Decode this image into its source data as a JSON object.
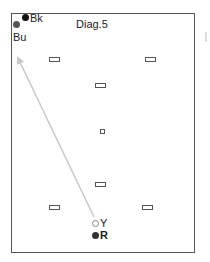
{
  "diagram": {
    "title": "Diag.5",
    "colors": {
      "frame": "#555555",
      "arrow": "#c8c8c8",
      "black_marker": "#111111",
      "grey_marker": "#555555",
      "hollow_marker": "#888888",
      "dash": "#555555"
    },
    "markers": [
      {
        "id": "Bk",
        "label": "Bk",
        "style": "filled-black"
      },
      {
        "id": "Bu",
        "label": "Bu",
        "style": "filled-grey"
      },
      {
        "id": "Y",
        "label": "Y",
        "style": "hollow-grey"
      },
      {
        "id": "R",
        "label": "R",
        "style": "filled-dark"
      }
    ],
    "arrow": {
      "from": "Y",
      "to": "Bu",
      "direction": "toward top-left"
    },
    "dashes_count": 7
  }
}
